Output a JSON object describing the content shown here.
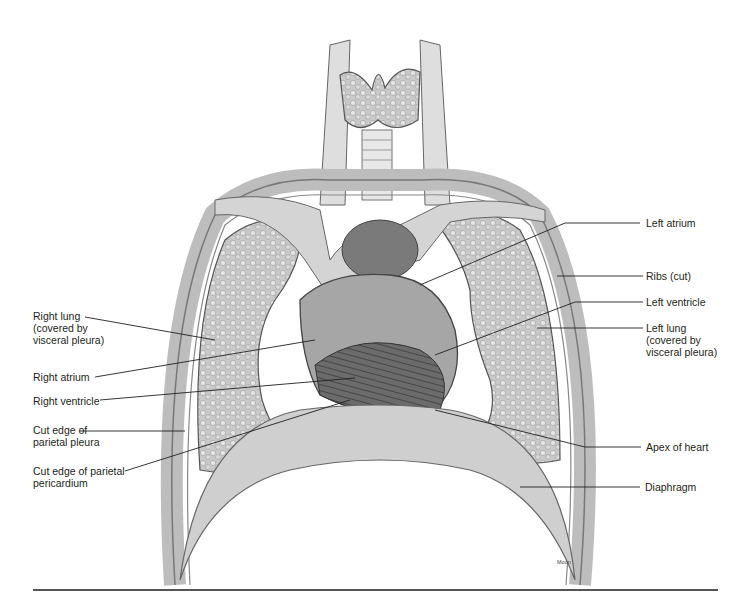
{
  "figure": {
    "credit": "Moon",
    "colors": {
      "ink": "#231f20",
      "tissue_light": "#d9d9d9",
      "tissue_mid": "#a8a8a8",
      "tissue_dark": "#5a5a5a",
      "rule": "#555555"
    }
  },
  "labels": {
    "left_side": [
      {
        "id": "right-lung",
        "text": "Right lung\n(covered by\nvisceral pleura)"
      },
      {
        "id": "right-atrium",
        "text": "Right atrium"
      },
      {
        "id": "right-ventricle",
        "text": "Right ventricle"
      },
      {
        "id": "cut-edge-parietal-pleura",
        "text": "Cut edge of\nparietal pleura"
      },
      {
        "id": "cut-edge-parietal-pericardium",
        "text": "Cut edge of parietal\npericardium"
      }
    ],
    "right_side": [
      {
        "id": "left-atrium",
        "text": "Left atrium"
      },
      {
        "id": "ribs-cut",
        "text": "Ribs (cut)"
      },
      {
        "id": "left-ventricle",
        "text": "Left ventricle"
      },
      {
        "id": "left-lung",
        "text": "Left lung\n(covered by\nvisceral pleura)"
      },
      {
        "id": "apex-of-heart",
        "text": "Apex of heart"
      },
      {
        "id": "diaphragm",
        "text": "Diaphragm"
      }
    ]
  }
}
